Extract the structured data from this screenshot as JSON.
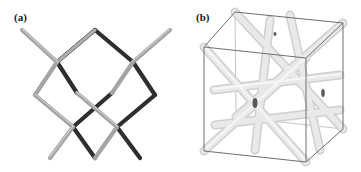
{
  "figure": {
    "panels": [
      {
        "id": "a",
        "label": "(a)",
        "description": "diamond-like lattice of cylindrical struts",
        "colors": {
          "strut_light": "#a8a8a8",
          "strut_dark": "#2e2e2e",
          "highlight": "#e6e6e6"
        }
      },
      {
        "id": "b",
        "label": "(b)",
        "description": "cubic unit cell containing intersecting struts",
        "colors": {
          "cube_edge": "#6e6e6e",
          "strut_fill": "#e4e4e4",
          "strut_shade": "#c9c9c9",
          "node_dark": "#5a5a5a"
        }
      }
    ]
  }
}
